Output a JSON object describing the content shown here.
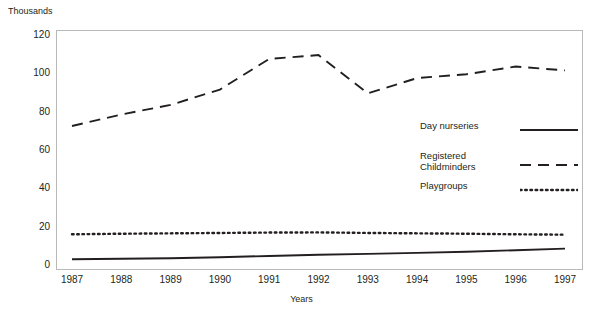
{
  "top_partial_text": "",
  "unit_label": "Thousands",
  "axis": {
    "x_title": "Years",
    "y_ticks": [
      "0",
      "20",
      "40",
      "60",
      "80",
      "100",
      "120"
    ],
    "x_ticks": [
      "1987",
      "1988",
      "1989",
      "1990",
      "1991",
      "1992",
      "1993",
      "1994",
      "1995",
      "1996",
      "1997"
    ]
  },
  "legend": {
    "items": [
      {
        "label": "Day nurseries",
        "style": "solid"
      },
      {
        "label": "Registered\nChildminders",
        "style": "dashed"
      },
      {
        "label": "Playgroups",
        "style": "dotted"
      }
    ]
  },
  "chart_data": {
    "type": "line",
    "title": "",
    "subtitle": "",
    "xlabel": "Years",
    "ylabel": "Thousands",
    "x": [
      1987,
      1988,
      1989,
      1990,
      1991,
      1992,
      1993,
      1994,
      1995,
      1996,
      1997
    ],
    "xlim": [
      1987,
      1997
    ],
    "ylim": [
      0,
      120
    ],
    "ytick_interval": 20,
    "grid": false,
    "legend_position": "inside-right",
    "series": [
      {
        "name": "Day nurseries",
        "style": "solid",
        "color": "#231f20",
        "values": [
          2.5,
          2.7,
          3.0,
          3.5,
          4.2,
          4.8,
          5.3,
          5.8,
          6.4,
          7.2,
          8.0
        ]
      },
      {
        "name": "Registered Childminders",
        "style": "dashed",
        "color": "#231f20",
        "values": [
          72,
          78,
          83,
          91,
          107,
          109,
          89,
          97,
          99,
          103,
          101
        ]
      },
      {
        "name": "Playgroups",
        "style": "dotted",
        "color": "#231f20",
        "values": [
          15.5,
          15.8,
          16.0,
          16.2,
          16.4,
          16.5,
          16.2,
          16.0,
          15.8,
          15.5,
          15.3
        ]
      }
    ]
  }
}
